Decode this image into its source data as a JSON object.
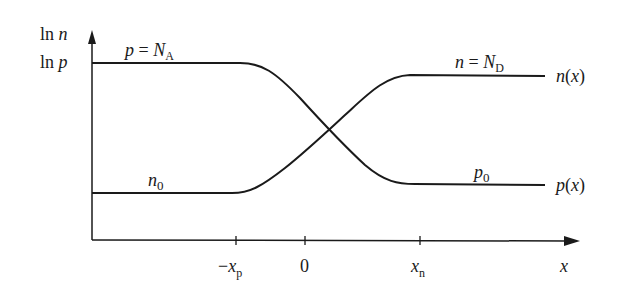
{
  "diagram": {
    "y_axis": {
      "label_line1": "ln n",
      "label_line2": "ln p"
    },
    "x_axis": {
      "label": "x",
      "ticks": [
        "−x",
        "0",
        "x"
      ],
      "tick_subscripts": [
        "p",
        "",
        "n"
      ]
    },
    "labels": {
      "p_left": "p = N",
      "p_left_sub": "A",
      "n_right": "n = N",
      "n_right_sub": "D",
      "n_left": "n",
      "n_left_sub": "0",
      "p_right": "p",
      "p_right_sub": "0",
      "n_curve": "n(x)",
      "p_curve": "p(x)"
    },
    "colors": {
      "line": "#1a1a1a",
      "background": "#ffffff"
    }
  }
}
